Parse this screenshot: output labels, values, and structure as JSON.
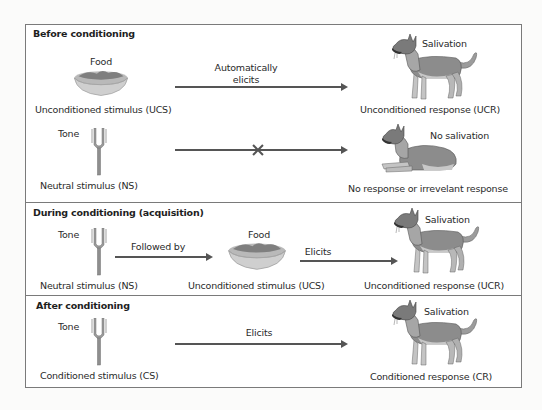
{
  "diagram": {
    "type": "classical-conditioning-flow",
    "colors": {
      "frame": "#7a7a7a",
      "arrow": "#555555",
      "dog_body": "#8a8a8a",
      "dog_light": "#c9c9c9",
      "bowl": "#c8c8c8",
      "fork": "#9a9a9a"
    }
  },
  "sections": [
    {
      "title": "Before conditioning",
      "rows": [
        {
          "stimulus_top_label": "Food",
          "stimulus_icon": "food-bowl-icon",
          "stimulus_label": "Unconditioned stimulus (UCS)",
          "arrow_label_line1": "Automatically",
          "arrow_label_line2": "elicits",
          "arrow_blocked": false,
          "response_top_label": "Salivation",
          "response_icon": "standing-dog-icon",
          "response_label": "Unconditioned response (UCR)"
        },
        {
          "stimulus_top_label": "Tone",
          "stimulus_icon": "tuning-fork-icon",
          "stimulus_label": "Neutral stimulus (NS)",
          "arrow_label_line1": "",
          "arrow_label_line2": "",
          "arrow_blocked": true,
          "response_top_label": "No salivation",
          "response_icon": "lying-dog-icon",
          "response_label": "No response or irrevelant response"
        }
      ]
    },
    {
      "title": "During conditioning (acquisition)",
      "rows": [
        {
          "stimulus_top_label": "Tone",
          "stimulus_icon": "tuning-fork-icon",
          "stimulus_label": "Neutral stimulus (NS)",
          "first_arrow_label": "Followed by",
          "middle_top_label": "Food",
          "middle_icon": "food-bowl-icon",
          "middle_label": "Unconditioned stimulus (UCS)",
          "second_arrow_label": "Elicits",
          "response_top_label": "Salivation",
          "response_icon": "standing-dog-icon",
          "response_label": "Unconditioned response (UCR)"
        }
      ]
    },
    {
      "title": "After conditioning",
      "rows": [
        {
          "stimulus_top_label": "Tone",
          "stimulus_icon": "tuning-fork-icon",
          "stimulus_label": "Conditioned stimulus (CS)",
          "arrow_label": "Elicits",
          "response_top_label": "Salivation",
          "response_icon": "standing-dog-icon",
          "response_label": "Conditioned response (CR)"
        }
      ]
    }
  ]
}
